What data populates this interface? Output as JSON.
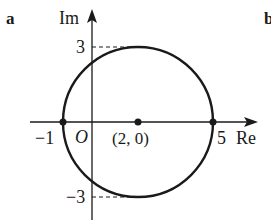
{
  "figure": {
    "panel_label": "a",
    "next_panel_label": "b",
    "axes": {
      "x_label": "Re",
      "y_label": "Im",
      "origin_label": "O"
    },
    "ticks": {
      "x_neg": "−1",
      "x_pos": "5",
      "y_pos": "3",
      "y_neg": "−3"
    },
    "center_label": "(2, 0)",
    "circle": {
      "center_re": 2,
      "center_im": 0,
      "radius": 3
    },
    "marked_points": [
      "-1",
      "(2, 0)",
      "5"
    ],
    "colors": {
      "stroke": "#1a1a1a",
      "background": "#ffffff"
    }
  }
}
